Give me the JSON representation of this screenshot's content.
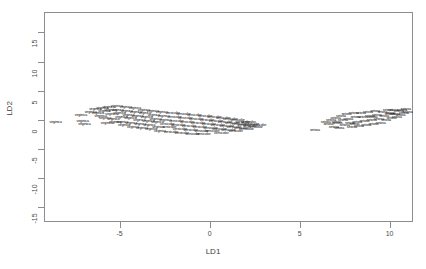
{
  "chart_data": {
    "type": "scatter",
    "title": "",
    "xlabel": "LD1",
    "ylabel": "LD2",
    "xlim": [
      -9.2,
      11.3
    ],
    "ylim": [
      -17.5,
      18.5
    ],
    "grid": false,
    "legend_position": "none",
    "point_marker": "text-label",
    "xticks": [
      -5,
      0,
      5,
      10
    ],
    "xticklabels": [
      "-5",
      "0",
      "5",
      "10"
    ],
    "yticks": [
      15,
      10,
      5,
      0,
      -5,
      -10,
      -15
    ],
    "yticklabels": [
      "15",
      "10",
      "5",
      "0",
      "-5",
      "-10",
      "-15"
    ],
    "series": [
      {
        "name": "virginica",
        "label": "virginica",
        "points": [
          [
            -8.55,
            -0.55
          ],
          [
            -7.15,
            0.75
          ],
          [
            -7.05,
            -0.3
          ],
          [
            -6.95,
            -0.95
          ],
          [
            -6.6,
            1.15
          ],
          [
            -6.35,
            1.75
          ],
          [
            -6.2,
            1.05
          ],
          [
            -6.05,
            0.45
          ],
          [
            -5.95,
            1.95
          ],
          [
            -5.85,
            1.3
          ],
          [
            -5.8,
            0.1
          ],
          [
            -5.7,
            -0.7
          ],
          [
            -5.6,
            2.1
          ],
          [
            -5.5,
            1.55
          ],
          [
            -5.45,
            0.8
          ],
          [
            -5.35,
            0.05
          ],
          [
            -5.25,
            -0.55
          ],
          [
            -5.15,
            2.25
          ],
          [
            -5.1,
            1.45
          ],
          [
            -5.0,
            0.95
          ],
          [
            -4.9,
            0.25
          ],
          [
            -4.85,
            -0.45
          ],
          [
            -4.75,
            -1.1
          ],
          [
            -4.65,
            2.05
          ],
          [
            -4.6,
            1.35
          ],
          [
            -4.5,
            0.7
          ],
          [
            -4.4,
            0.1
          ],
          [
            -4.35,
            -0.65
          ],
          [
            -4.25,
            -1.35
          ],
          [
            -4.15,
            1.85
          ],
          [
            -4.1,
            1.15
          ],
          [
            -4.0,
            0.5
          ],
          [
            -3.9,
            -0.15
          ],
          [
            -3.85,
            -0.85
          ],
          [
            -3.75,
            -1.55
          ],
          [
            -3.65,
            1.6
          ],
          [
            -3.6,
            0.95
          ],
          [
            -3.5,
            0.3
          ],
          [
            -3.4,
            -0.4
          ],
          [
            -3.35,
            -1.05
          ],
          [
            -3.25,
            -1.7
          ],
          [
            -3.15,
            1.4
          ],
          [
            -3.1,
            0.75
          ],
          [
            -3.0,
            0.05
          ],
          [
            -2.9,
            -0.6
          ],
          [
            -2.85,
            -1.3
          ],
          [
            -2.75,
            -2.05
          ],
          [
            -2.65,
            1.2
          ],
          [
            -2.55,
            0.55
          ],
          [
            -2.45,
            -0.15
          ]
        ]
      },
      {
        "name": "versicolor",
        "label": "versicolor",
        "points": [
          [
            -2.35,
            -0.8
          ],
          [
            -2.25,
            -1.45
          ],
          [
            -2.15,
            -2.2
          ],
          [
            -2.05,
            1.0
          ],
          [
            -1.95,
            0.35
          ],
          [
            -1.85,
            -0.3
          ],
          [
            -1.75,
            -1.0
          ],
          [
            -1.65,
            -1.65
          ],
          [
            -1.55,
            -2.35
          ],
          [
            -1.45,
            0.85
          ],
          [
            -1.35,
            0.15
          ],
          [
            -1.25,
            -0.5
          ],
          [
            -1.15,
            -1.15
          ],
          [
            -1.05,
            -1.85
          ],
          [
            -0.95,
            -2.5
          ],
          [
            -0.85,
            0.65
          ],
          [
            -0.75,
            0.0
          ],
          [
            -0.65,
            -0.65
          ],
          [
            -0.55,
            -1.35
          ],
          [
            -0.45,
            -2.0
          ],
          [
            -0.35,
            -2.65
          ],
          [
            -0.25,
            0.5
          ],
          [
            -0.15,
            -0.2
          ],
          [
            -0.05,
            -0.85
          ],
          [
            0.05,
            -1.5
          ],
          [
            0.15,
            -2.15
          ],
          [
            0.25,
            0.3
          ],
          [
            0.35,
            -0.4
          ],
          [
            0.45,
            -1.05
          ],
          [
            0.55,
            -1.7
          ],
          [
            0.65,
            -2.35
          ],
          [
            0.75,
            0.15
          ],
          [
            0.85,
            -0.55
          ],
          [
            0.95,
            -1.2
          ],
          [
            1.05,
            -1.85
          ],
          [
            1.15,
            0.0
          ],
          [
            1.25,
            -0.7
          ],
          [
            1.35,
            -1.4
          ],
          [
            1.45,
            -2.05
          ],
          [
            1.55,
            -0.25
          ],
          [
            1.65,
            -0.9
          ],
          [
            1.75,
            -1.55
          ],
          [
            1.85,
            -0.45
          ],
          [
            1.95,
            -1.1
          ],
          [
            2.05,
            -1.75
          ],
          [
            2.15,
            -0.6
          ],
          [
            2.25,
            -1.25
          ],
          [
            2.35,
            -0.8
          ],
          [
            2.55,
            -1.4
          ],
          [
            2.75,
            -1.0
          ]
        ]
      },
      {
        "name": "setosa",
        "label": "setosa",
        "points": [
          [
            5.85,
            -1.95
          ],
          [
            6.45,
            -0.5
          ],
          [
            6.6,
            -0.95
          ],
          [
            6.75,
            -0.2
          ],
          [
            6.9,
            -1.3
          ],
          [
            7.0,
            0.2
          ],
          [
            7.1,
            -0.65
          ],
          [
            7.2,
            -1.5
          ],
          [
            7.3,
            0.55
          ],
          [
            7.4,
            -0.25
          ],
          [
            7.5,
            -1.05
          ],
          [
            7.6,
            0.85
          ],
          [
            7.7,
            0.05
          ],
          [
            7.8,
            -0.75
          ],
          [
            7.9,
            -1.45
          ],
          [
            8.0,
            0.95
          ],
          [
            8.1,
            0.25
          ],
          [
            8.2,
            -0.5
          ],
          [
            8.3,
            -1.2
          ],
          [
            8.4,
            1.05
          ],
          [
            8.5,
            0.4
          ],
          [
            8.6,
            -0.35
          ],
          [
            8.7,
            -1.0
          ],
          [
            8.8,
            1.15
          ],
          [
            8.9,
            0.5
          ],
          [
            9.0,
            -0.2
          ],
          [
            9.1,
            -0.85
          ],
          [
            9.2,
            1.35
          ],
          [
            9.3,
            0.65
          ],
          [
            9.4,
            0.0
          ],
          [
            9.5,
            -0.65
          ],
          [
            9.6,
            1.2
          ],
          [
            9.7,
            0.55
          ],
          [
            9.8,
            -0.1
          ],
          [
            9.9,
            1.45
          ],
          [
            10.0,
            0.8
          ],
          [
            10.1,
            0.15
          ],
          [
            10.2,
            1.55
          ],
          [
            10.3,
            0.9
          ],
          [
            10.4,
            0.3
          ],
          [
            10.5,
            1.3
          ],
          [
            10.6,
            0.6
          ],
          [
            10.7,
            1.6
          ],
          [
            10.8,
            1.0
          ],
          [
            10.9,
            1.7
          ],
          [
            11.0,
            1.25
          ],
          [
            7.05,
            -0.45
          ],
          [
            8.05,
            -0.95
          ],
          [
            9.05,
            0.35
          ],
          [
            10.05,
            1.1
          ]
        ]
      }
    ]
  }
}
